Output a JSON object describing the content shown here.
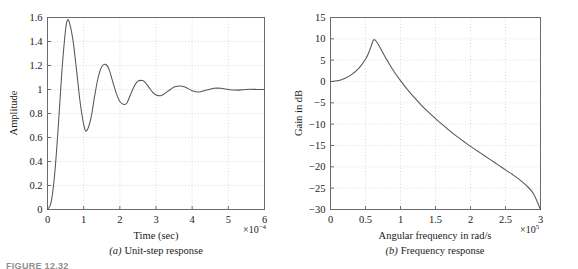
{
  "figure": {
    "label": "FIGURE 12.32"
  },
  "panel_a": {
    "caption_index": "(a)",
    "caption_text": "Unit-step response",
    "xlabel": "Time (sec)",
    "ylabel": "Amplitude",
    "multiplier_base": "×10",
    "multiplier_exp": "−4"
  },
  "panel_b": {
    "caption_index": "(b)",
    "caption_text": "Frequency response",
    "xlabel": "Angular frequency in rad/s",
    "ylabel": "Gain in dB",
    "multiplier_base": "×10",
    "multiplier_exp": "5"
  },
  "colors": {
    "curve": "#555555",
    "frame": "#6b6b6b",
    "grid": "#c9c9c9",
    "text": "#1a1a1a"
  },
  "chart_data": [
    {
      "type": "line",
      "id": "unit-step-response",
      "title": "(a) Unit-step response",
      "xlabel": "Time (sec)",
      "ylabel": "Amplitude",
      "x_multiplier": 0.0001,
      "x_multiplier_label": "×10⁻⁴",
      "xlim": [
        0,
        6
      ],
      "ylim": [
        0,
        1.6
      ],
      "xticks": [
        0,
        1,
        2,
        3,
        4,
        5,
        6
      ],
      "xticklabels": [
        "0",
        "1",
        "2",
        "3",
        "4",
        "5",
        "6"
      ],
      "yticks": [
        0,
        0.2,
        0.4,
        0.6,
        0.8,
        1,
        1.2,
        1.4,
        1.6
      ],
      "yticklabels": [
        "0",
        "0.2",
        "0.4",
        "0.6",
        "0.8",
        "1",
        "1.2",
        "1.4",
        "1.6"
      ],
      "grid": true,
      "legend": null,
      "annotations": [],
      "description": "Underdamped second-order step response settling to steady-state value 1",
      "features": {
        "steady_state": 1.0,
        "first_overshoot_value": 1.575,
        "first_overshoot_time": 0.55,
        "first_undershoot_value": 0.655,
        "first_undershoot_time": 1.08,
        "second_peak_value": 1.21,
        "second_peak_time": 1.6,
        "second_trough_value": 0.875,
        "second_trough_time": 2.12,
        "third_peak_value": 1.075,
        "third_peak_time": 2.62,
        "third_trough_value": 0.95,
        "third_trough_time": 3.15,
        "fourth_peak_value": 1.03,
        "fourth_peak_time": 3.66,
        "damped_period": 1.05,
        "decay_rate_per_unit": 2.25
      },
      "x": [
        0,
        0.1,
        0.2,
        0.3,
        0.4,
        0.5,
        0.55,
        0.6,
        0.7,
        0.8,
        0.9,
        1.0,
        1.08,
        1.2,
        1.3,
        1.4,
        1.5,
        1.6,
        1.7,
        1.8,
        1.9,
        2.0,
        2.12,
        2.2,
        2.3,
        2.4,
        2.5,
        2.62,
        2.7,
        2.8,
        2.9,
        3.0,
        3.15,
        3.3,
        3.4,
        3.5,
        3.66,
        3.8,
        4.0,
        4.2,
        4.4,
        4.6,
        4.8,
        5.0,
        5.2,
        5.4,
        5.6,
        5.8,
        6.0
      ],
      "y": [
        0,
        0.06,
        0.3,
        0.7,
        1.16,
        1.5,
        1.575,
        1.565,
        1.42,
        1.17,
        0.9,
        0.71,
        0.655,
        0.76,
        0.94,
        1.1,
        1.19,
        1.21,
        1.17,
        1.07,
        0.97,
        0.9,
        0.875,
        0.89,
        0.96,
        1.03,
        1.07,
        1.075,
        1.06,
        1.02,
        0.98,
        0.955,
        0.95,
        0.98,
        1.0,
        1.02,
        1.03,
        1.02,
        0.99,
        0.98,
        0.995,
        1.01,
        1.01,
        1.0,
        0.995,
        0.998,
        1.002,
        1.0,
        1.0
      ]
    },
    {
      "type": "line",
      "id": "frequency-response",
      "title": "(b) Frequency response",
      "xlabel": "Angular frequency in rad/s",
      "ylabel": "Gain in dB",
      "x_multiplier": 100000.0,
      "x_multiplier_label": "×10⁵",
      "xlim": [
        0,
        3
      ],
      "ylim": [
        -30,
        15
      ],
      "xticks": [
        0,
        0.5,
        1,
        1.5,
        2,
        2.5,
        3
      ],
      "xticklabels": [
        "0",
        "0.5",
        "1",
        "1.5",
        "2",
        "2.5",
        "3"
      ],
      "yticks": [
        -30,
        -25,
        -20,
        -15,
        -10,
        -5,
        0,
        5,
        10,
        15
      ],
      "yticklabels": [
        "−30",
        "−25",
        "−20",
        "−15",
        "−10",
        "−5",
        "0",
        "5",
        "10",
        "15"
      ],
      "grid": true,
      "legend": null,
      "annotations": [],
      "description": "Resonant peak near 0.62×10⁵ rad/s then roll-off",
      "features": {
        "dc_gain_db": 0.0,
        "peak_gain_db": 9.8,
        "peak_frequency": 0.62,
        "end_gain_db": -30.0,
        "end_frequency": 3.0
      },
      "x": [
        0,
        0.1,
        0.2,
        0.3,
        0.4,
        0.5,
        0.55,
        0.6,
        0.62,
        0.65,
        0.7,
        0.8,
        0.9,
        1.0,
        1.1,
        1.2,
        1.3,
        1.4,
        1.5,
        1.6,
        1.7,
        1.8,
        1.9,
        2.0,
        2.1,
        2.2,
        2.3,
        2.4,
        2.5,
        2.6,
        2.7,
        2.8,
        2.9,
        3.0
      ],
      "y": [
        0.0,
        0.15,
        0.7,
        1.6,
        3.0,
        5.2,
        6.9,
        9.2,
        9.8,
        9.5,
        8.2,
        5.2,
        2.5,
        0.2,
        -1.9,
        -3.8,
        -5.6,
        -7.2,
        -8.7,
        -10.1,
        -11.5,
        -12.8,
        -14.0,
        -15.2,
        -16.3,
        -17.4,
        -18.5,
        -19.6,
        -20.7,
        -21.8,
        -23.0,
        -24.4,
        -26.3,
        -30.0
      ]
    }
  ]
}
